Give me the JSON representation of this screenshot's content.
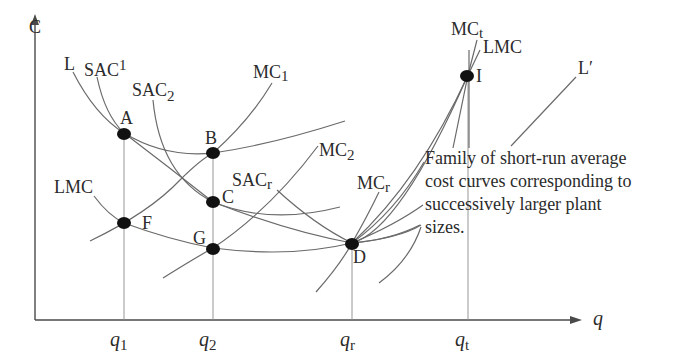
{
  "diagram": {
    "title": "",
    "y_axis": {
      "label": "C"
    },
    "x_axis": {
      "label": "q",
      "ticks": [
        {
          "base": "q",
          "sub": "1"
        },
        {
          "base": "q",
          "sub": "2"
        },
        {
          "base": "q",
          "sub": "r"
        },
        {
          "base": "q",
          "sub": "t"
        }
      ]
    },
    "curve_labels": {
      "L": "L",
      "SAC1": {
        "base": "SAC",
        "sub": "1"
      },
      "SAC2": {
        "base": "SAC",
        "sub": "2"
      },
      "SACr": {
        "base": "SAC",
        "sub": "r"
      },
      "MC1": {
        "base": "MC",
        "sub": "1"
      },
      "MC2": {
        "base": "MC",
        "sub": "2"
      },
      "MCr": {
        "base": "MC",
        "sub": "r"
      },
      "MCt": {
        "base": "MC",
        "sub": "t"
      },
      "LMC_left": "LMC",
      "LMC_top": "LMC",
      "Lprime": "L′"
    },
    "points": {
      "A": "A",
      "B": "B",
      "C": "C",
      "D": "D",
      "F": "F",
      "G": "G",
      "I": "I"
    },
    "annotation": {
      "lines": [
        "Family of short-run average",
        "cost curves corresponding to",
        "successively larger plant",
        "sizes."
      ]
    },
    "colors": {
      "curve": "#6a6a6a",
      "axis": "#4a4a4a",
      "point": "#111111",
      "text": "#2b2b2b"
    }
  }
}
